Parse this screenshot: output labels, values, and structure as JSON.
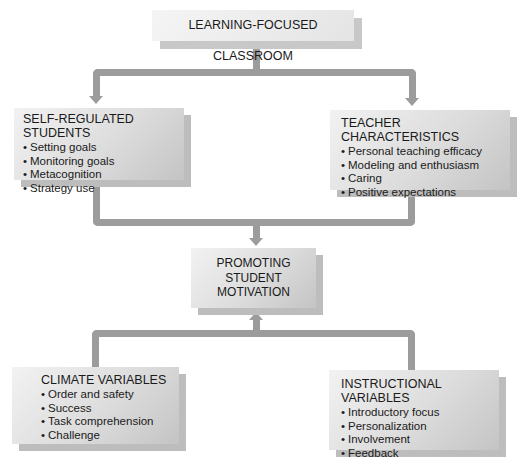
{
  "diagram": {
    "top": {
      "title": "LEARNING-FOCUSED CLASSROOM"
    },
    "self_regulated": {
      "title": "SELF-REGULATED STUDENTS",
      "items": [
        "Setting goals",
        "Monitoring goals",
        "Metacognition",
        "Strategy use"
      ]
    },
    "teacher": {
      "title": "TEACHER CHARACTERISTICS",
      "items": [
        "Personal teaching efficacy",
        "Modeling and enthusiasm",
        "Caring",
        "Positive expectations"
      ]
    },
    "center": {
      "line1": "PROMOTING",
      "line2": "STUDENT",
      "line3": "MOTIVATION"
    },
    "climate": {
      "title": "CLIMATE VARIABLES",
      "items": [
        "Order and safety",
        "Success",
        "Task comprehension",
        "Challenge"
      ]
    },
    "instructional": {
      "title": "INSTRUCTIONAL VARIABLES",
      "items": [
        "Introductory focus",
        "Personalization",
        "Involvement",
        "Feedback"
      ]
    },
    "colors": {
      "connector": "#9c9c9c",
      "box_light": "#f2f2f2",
      "box_dark": "#c4c4c4",
      "shadow": "#bdbdbd"
    }
  }
}
